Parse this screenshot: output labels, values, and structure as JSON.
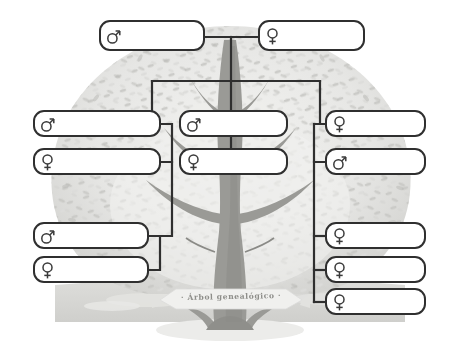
{
  "document": {
    "title": "Árbol genealógico",
    "banner_label": "· Árbol genealógico ·",
    "language": "es",
    "kind": "blank family tree template"
  },
  "palette": {
    "page_background": "#ffffff",
    "box_border": "#2f2f2f",
    "box_fill": "#ffffff",
    "connector": "#2f2f2f",
    "foliage_light": "#e8e8e6",
    "foliage_mid": "#c9c9c6",
    "foliage_dark": "#a9a9a5",
    "trunk": "#9a9a96",
    "trunk_dark": "#8a8a86",
    "ground": "#d6d6d3",
    "banner_fill": "#f0f0ee",
    "banner_text": "#8e8e8a",
    "shadow": "#ececea"
  },
  "symbols": {
    "male": "♂",
    "female": "♀",
    "male_name": "male-gender-icon",
    "female_name": "female-gender-icon"
  },
  "generations": [
    {
      "id": "gen-1",
      "label": "great-grandparents",
      "nodes": [
        {
          "id": "g1-father",
          "sex": "male",
          "name": "",
          "x": 99,
          "y": 20,
          "w": 106,
          "h": 31
        },
        {
          "id": "g1-mother",
          "sex": "female",
          "name": "",
          "x": 258,
          "y": 20,
          "w": 107,
          "h": 31
        }
      ]
    },
    {
      "id": "gen-2",
      "label": "grandparents",
      "nodes": [
        {
          "id": "g2-left-male",
          "sex": "male",
          "name": "",
          "x": 33,
          "y": 110,
          "w": 128,
          "h": 27
        },
        {
          "id": "g2-left-female",
          "sex": "female",
          "name": "",
          "x": 33,
          "y": 148,
          "w": 128,
          "h": 27
        },
        {
          "id": "g2-mid-male",
          "sex": "male",
          "name": "",
          "x": 179,
          "y": 110,
          "w": 109,
          "h": 27
        },
        {
          "id": "g2-mid-female",
          "sex": "female",
          "name": "",
          "x": 179,
          "y": 148,
          "w": 109,
          "h": 27
        },
        {
          "id": "g2-right-female",
          "sex": "female",
          "name": "",
          "x": 325,
          "y": 110,
          "w": 101,
          "h": 27
        },
        {
          "id": "g2-right-male",
          "sex": "male",
          "name": "",
          "x": 325,
          "y": 148,
          "w": 101,
          "h": 27
        }
      ]
    },
    {
      "id": "gen-3",
      "label": "parents-and-children",
      "nodes": [
        {
          "id": "g3-left-male",
          "sex": "male",
          "name": "",
          "x": 33,
          "y": 222,
          "w": 116,
          "h": 27
        },
        {
          "id": "g3-left-female",
          "sex": "female",
          "name": "",
          "x": 33,
          "y": 256,
          "w": 116,
          "h": 27
        },
        {
          "id": "g3-right-f1",
          "sex": "female",
          "name": "",
          "x": 325,
          "y": 222,
          "w": 101,
          "h": 27
        },
        {
          "id": "g3-right-f2",
          "sex": "female",
          "name": "",
          "x": 325,
          "y": 256,
          "w": 101,
          "h": 27
        },
        {
          "id": "g3-right-f3",
          "sex": "female",
          "name": "",
          "x": 325,
          "y": 288,
          "w": 101,
          "h": 27
        }
      ]
    }
  ],
  "connectors": {
    "description": "Orthogonal black rule lines linking the name plates",
    "segments": [
      {
        "id": "g1-couple-join",
        "type": "horizontal",
        "x1": 205,
        "y1": 37,
        "x2": 258,
        "y2": 37
      },
      {
        "id": "g1-drop-to-bus",
        "type": "vertical",
        "x1": 231,
        "y1": 37,
        "x2": 231,
        "y2": 81
      },
      {
        "id": "gen2-distribution",
        "type": "horizontal",
        "x1": 152,
        "y1": 81,
        "x2": 320,
        "y2": 81
      },
      {
        "id": "bus-drop-left",
        "type": "vertical",
        "x1": 152,
        "y1": 81,
        "x2": 152,
        "y2": 124
      },
      {
        "id": "bus-stub-left",
        "type": "horizontal",
        "x1": 152,
        "y1": 124,
        "x2": 161,
        "y2": 124
      },
      {
        "id": "bus-drop-center",
        "type": "vertical",
        "x1": 231,
        "y1": 81,
        "x2": 231,
        "y2": 110
      },
      {
        "id": "bus-drop-right",
        "type": "vertical",
        "x1": 320,
        "y1": 81,
        "x2": 320,
        "y2": 124
      },
      {
        "id": "bus-stub-right",
        "type": "horizontal",
        "x1": 320,
        "y1": 124,
        "x2": 325,
        "y2": 124
      },
      {
        "id": "g2-left-pair-join",
        "type": "polyline",
        "points": "161,124 172,124 172,162 161,162"
      },
      {
        "id": "g2-mid-pair-join",
        "type": "vertical",
        "x1": 231,
        "y1": 137,
        "x2": 231,
        "y2": 148
      },
      {
        "id": "g2-right-pair-join",
        "type": "polyline",
        "points": "325,124 314,124 314,162 325,162"
      },
      {
        "id": "g2-left-to-g3",
        "type": "polyline",
        "points": "172,162 172,236 160,236"
      },
      {
        "id": "g3-left-pair-join",
        "type": "polyline",
        "points": "149,236 160,236 160,270 149,270"
      },
      {
        "id": "g2-right-to-g3",
        "type": "polyline",
        "points": "314,162 314,236 325,236"
      },
      {
        "id": "g3-right-bracket",
        "type": "vertical",
        "x1": 314,
        "y1": 236,
        "x2": 314,
        "y2": 302
      },
      {
        "id": "g3-right-stub-1",
        "type": "horizontal",
        "x1": 314,
        "y1": 236,
        "x2": 325,
        "y2": 236
      },
      {
        "id": "g3-right-stub-2",
        "type": "horizontal",
        "x1": 314,
        "y1": 270,
        "x2": 325,
        "y2": 270
      },
      {
        "id": "g3-right-stub-3",
        "type": "horizontal",
        "x1": 314,
        "y1": 302,
        "x2": 325,
        "y2": 302
      }
    ]
  },
  "artwork": {
    "tree_name": "family-tree-illustration",
    "trunk_name": "tree-trunk",
    "foliage_name": "tree-foliage",
    "ground_name": "ground-band",
    "banner_name": "title-banner",
    "shadow_name": "tree-shadow"
  }
}
